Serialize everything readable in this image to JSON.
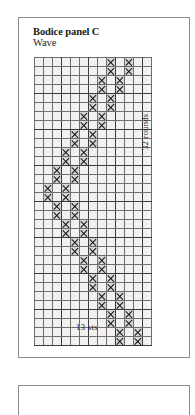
{
  "document": {
    "page_background": "#ffffff",
    "frame_color": "#8d8d8d"
  },
  "chart_panel": {
    "title": "Bodice panel C",
    "subtitle": "Wave",
    "x_axis_label": "13 sts",
    "y_axis_label": "32 rounds"
  },
  "next_panel": {
    "note": ""
  },
  "chart_data": {
    "type": "heatmap",
    "title": "Bodice panel C",
    "subtitle": "Wave",
    "xlabel": "13 sts",
    "ylabel": "32 rounds",
    "columns": 13,
    "rows": 32,
    "grid": true,
    "symbol": "X",
    "symbol_meaning": "worked stitch",
    "empty_color": "#f2f1ef",
    "filled_color": "#d9d7d4",
    "gridline_color": "#6e6e6e",
    "major_gridline_color": "#3a3a3a",
    "major_column_every": 3,
    "major_row_every": 4,
    "column_labels": [
      "1",
      "2",
      "3",
      "4",
      "5",
      "6",
      "7",
      "8",
      "9",
      "10",
      "11",
      "12",
      "13"
    ],
    "row_labels": [
      "1",
      "2",
      "3",
      "4",
      "5",
      "6",
      "7",
      "8",
      "9",
      "10",
      "11",
      "12",
      "13",
      "14",
      "15",
      "16",
      "17",
      "18",
      "19",
      "20",
      "21",
      "22",
      "23",
      "24",
      "25",
      "26",
      "27",
      "28",
      "29",
      "30",
      "31",
      "32"
    ],
    "marked_columns_by_row": [
      [
        9,
        11
      ],
      [
        9,
        11
      ],
      [
        8,
        10
      ],
      [
        8,
        10
      ],
      [
        7,
        9
      ],
      [
        7,
        9
      ],
      [
        6,
        8
      ],
      [
        6,
        8
      ],
      [
        5,
        7
      ],
      [
        5,
        7
      ],
      [
        4,
        6
      ],
      [
        4,
        6
      ],
      [
        3,
        5
      ],
      [
        3,
        5
      ],
      [
        2,
        4
      ],
      [
        2,
        4
      ],
      [
        3,
        5
      ],
      [
        3,
        5
      ],
      [
        4,
        6
      ],
      [
        4,
        6
      ],
      [
        5,
        7
      ],
      [
        5,
        7
      ],
      [
        6,
        8
      ],
      [
        6,
        8
      ],
      [
        7,
        9
      ],
      [
        7,
        9
      ],
      [
        8,
        10
      ],
      [
        8,
        10
      ],
      [
        9,
        11
      ],
      [
        9,
        11
      ],
      [
        10,
        12
      ],
      [
        10,
        12
      ]
    ],
    "cells": [
      [
        0,
        0,
        0,
        0,
        0,
        0,
        0,
        0,
        1,
        0,
        1,
        0,
        0
      ],
      [
        0,
        0,
        0,
        0,
        0,
        0,
        0,
        0,
        1,
        0,
        1,
        0,
        0
      ],
      [
        0,
        0,
        0,
        0,
        0,
        0,
        0,
        1,
        0,
        1,
        0,
        0,
        0
      ],
      [
        0,
        0,
        0,
        0,
        0,
        0,
        0,
        1,
        0,
        1,
        0,
        0,
        0
      ],
      [
        0,
        0,
        0,
        0,
        0,
        0,
        1,
        0,
        1,
        0,
        0,
        0,
        0
      ],
      [
        0,
        0,
        0,
        0,
        0,
        0,
        1,
        0,
        1,
        0,
        0,
        0,
        0
      ],
      [
        0,
        0,
        0,
        0,
        0,
        1,
        0,
        1,
        0,
        0,
        0,
        0,
        0
      ],
      [
        0,
        0,
        0,
        0,
        0,
        1,
        0,
        1,
        0,
        0,
        0,
        0,
        0
      ],
      [
        0,
        0,
        0,
        0,
        1,
        0,
        1,
        0,
        0,
        0,
        0,
        0,
        0
      ],
      [
        0,
        0,
        0,
        0,
        1,
        0,
        1,
        0,
        0,
        0,
        0,
        0,
        0
      ],
      [
        0,
        0,
        0,
        1,
        0,
        1,
        0,
        0,
        0,
        0,
        0,
        0,
        0
      ],
      [
        0,
        0,
        0,
        1,
        0,
        1,
        0,
        0,
        0,
        0,
        0,
        0,
        0
      ],
      [
        0,
        0,
        1,
        0,
        1,
        0,
        0,
        0,
        0,
        0,
        0,
        0,
        0
      ],
      [
        0,
        0,
        1,
        0,
        1,
        0,
        0,
        0,
        0,
        0,
        0,
        0,
        0
      ],
      [
        0,
        1,
        0,
        1,
        0,
        0,
        0,
        0,
        0,
        0,
        0,
        0,
        0
      ],
      [
        0,
        1,
        0,
        1,
        0,
        0,
        0,
        0,
        0,
        0,
        0,
        0,
        0
      ],
      [
        0,
        0,
        1,
        0,
        1,
        0,
        0,
        0,
        0,
        0,
        0,
        0,
        0
      ],
      [
        0,
        0,
        1,
        0,
        1,
        0,
        0,
        0,
        0,
        0,
        0,
        0,
        0
      ],
      [
        0,
        0,
        0,
        1,
        0,
        1,
        0,
        0,
        0,
        0,
        0,
        0,
        0
      ],
      [
        0,
        0,
        0,
        1,
        0,
        1,
        0,
        0,
        0,
        0,
        0,
        0,
        0
      ],
      [
        0,
        0,
        0,
        0,
        1,
        0,
        1,
        0,
        0,
        0,
        0,
        0,
        0
      ],
      [
        0,
        0,
        0,
        0,
        1,
        0,
        1,
        0,
        0,
        0,
        0,
        0,
        0
      ],
      [
        0,
        0,
        0,
        0,
        0,
        1,
        0,
        1,
        0,
        0,
        0,
        0,
        0
      ],
      [
        0,
        0,
        0,
        0,
        0,
        1,
        0,
        1,
        0,
        0,
        0,
        0,
        0
      ],
      [
        0,
        0,
        0,
        0,
        0,
        0,
        1,
        0,
        1,
        0,
        0,
        0,
        0
      ],
      [
        0,
        0,
        0,
        0,
        0,
        0,
        1,
        0,
        1,
        0,
        0,
        0,
        0
      ],
      [
        0,
        0,
        0,
        0,
        0,
        0,
        0,
        1,
        0,
        1,
        0,
        0,
        0
      ],
      [
        0,
        0,
        0,
        0,
        0,
        0,
        0,
        1,
        0,
        1,
        0,
        0,
        0
      ],
      [
        0,
        0,
        0,
        0,
        0,
        0,
        0,
        0,
        1,
        0,
        1,
        0,
        0
      ],
      [
        0,
        0,
        0,
        0,
        0,
        0,
        0,
        0,
        1,
        0,
        1,
        0,
        0
      ],
      [
        0,
        0,
        0,
        0,
        0,
        0,
        0,
        0,
        0,
        1,
        0,
        1,
        0
      ],
      [
        0,
        0,
        0,
        0,
        0,
        0,
        0,
        0,
        0,
        1,
        0,
        1,
        0
      ]
    ]
  }
}
